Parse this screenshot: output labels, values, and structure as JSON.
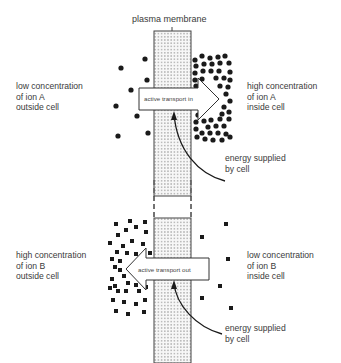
{
  "diagram": {
    "title": "plasma membrane",
    "top_section": {
      "left_label": "low concentration\nof ion A\noutside cell",
      "right_label": "high concentration\nof ion A\ninside cell",
      "arrow_label": "active transport in",
      "energy_label": "energy supplied\nby cell",
      "ion_shape": "circle"
    },
    "bottom_section": {
      "left_label": "high concentration\nof ion B\noutside cell",
      "right_label": "low concentration\nof ion B\ninside cell",
      "arrow_label": "active transport out",
      "energy_label": "energy supplied\nby cell",
      "ion_shape": "square"
    },
    "colors": {
      "ink": "#1a1a1a",
      "membrane_fill": "#f2f2f2",
      "text": "#3a3a3a"
    }
  }
}
